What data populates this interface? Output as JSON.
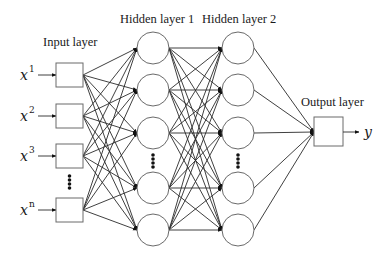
{
  "diagram": {
    "labels": {
      "input_layer": "Input layer",
      "hidden_layer_1": "Hidden layer 1",
      "hidden_layer_2": "Hidden layer 2",
      "output_layer": "Output layer"
    },
    "inputs": [
      {
        "var": "x",
        "sup": "1"
      },
      {
        "var": "x",
        "sup": "2"
      },
      {
        "var": "x",
        "sup": "3"
      },
      {
        "var": "x",
        "sup": "n"
      }
    ],
    "output": {
      "var": "y"
    },
    "layers": {
      "input": {
        "type": "box",
        "count_shown": 4,
        "has_ellipsis": true
      },
      "hidden_1": {
        "type": "circle",
        "count_shown": 5,
        "has_ellipsis": true
      },
      "hidden_2": {
        "type": "circle",
        "count_shown": 5,
        "has_ellipsis": true
      },
      "output": {
        "type": "box",
        "count_shown": 1
      }
    },
    "connectivity": "fully-connected",
    "colors": {
      "stroke": "#2a2a2a",
      "node_outline": "#6a6a6a",
      "background": "#ffffff"
    }
  }
}
